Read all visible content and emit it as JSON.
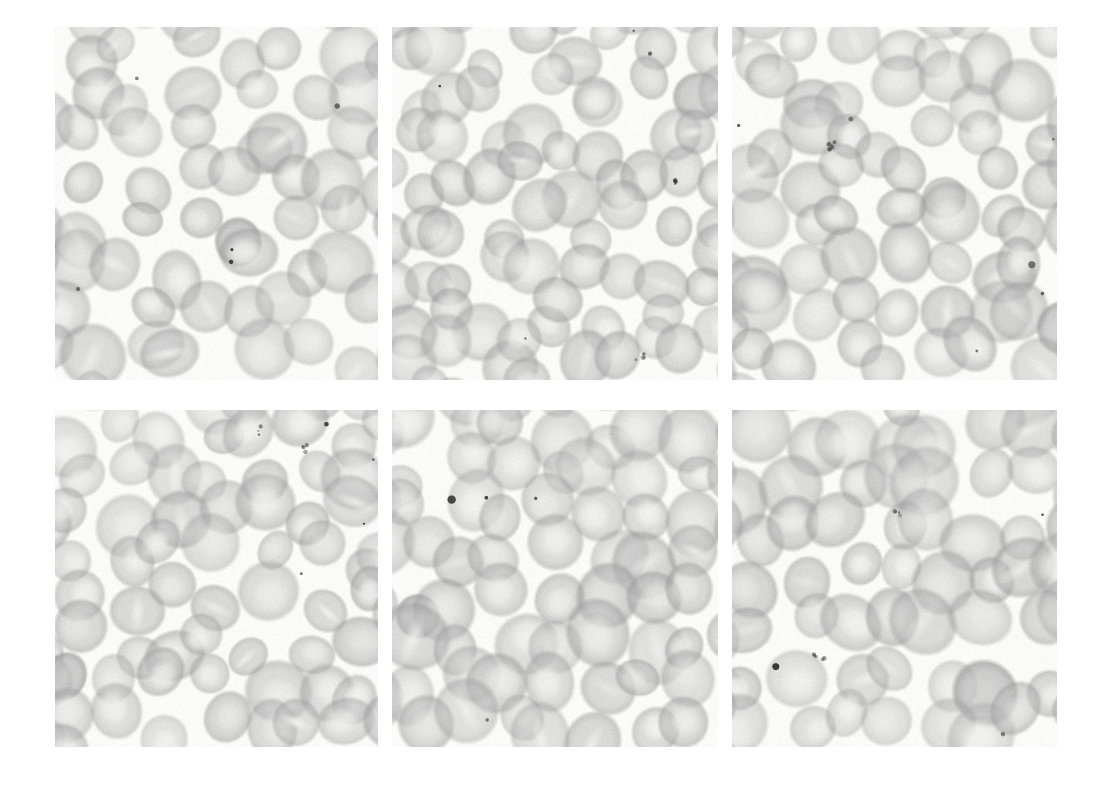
{
  "figure": {
    "kind": "micrograph-grid",
    "title": "",
    "caption": "",
    "background_color": "#ffffff",
    "width": 1110,
    "height": 792,
    "rows": 2,
    "columns": 3,
    "specimen": "peripheral blood smear",
    "stain_tone": "grayscale",
    "panel_background": "#fbfbfa",
    "cell_fill_color": "#b9b9b9",
    "cell_edge_color": "#9a9a9a",
    "cell_pallor_color": "#f2f2f1",
    "inclusion_color": "#2b2b2b"
  },
  "panels": [
    {
      "id": "panel-1",
      "label": "",
      "row": 0,
      "column": 0,
      "x": 55,
      "y": 27,
      "width": 323,
      "height": 353,
      "description": "sparse field of discoid red blood cells with prominent central pallor",
      "cell_count": 46,
      "mean_cell_diameter": 56,
      "density": "sparse",
      "seed": 1087,
      "inclusions": 5
    },
    {
      "id": "panel-2",
      "label": "",
      "row": 0,
      "column": 1,
      "x": 392,
      "y": 27,
      "width": 326,
      "height": 353,
      "description": "densely packed overlapping red blood cells, some with slit-like pallor",
      "cell_count": 62,
      "mean_cell_diameter": 54,
      "density": "dense",
      "seed": 2243,
      "inclusions": 6
    },
    {
      "id": "panel-3",
      "label": "",
      "row": 0,
      "column": 2,
      "x": 732,
      "y": 27,
      "width": 325,
      "height": 353,
      "description": "moderately packed red blood cells with dark punctate inclusion bodies",
      "cell_count": 54,
      "mean_cell_diameter": 57,
      "density": "moderate",
      "seed": 3391,
      "inclusions": 7
    },
    {
      "id": "panel-4",
      "label": "",
      "row": 1,
      "column": 0,
      "x": 55,
      "y": 410,
      "width": 323,
      "height": 337,
      "description": "red blood cells with variable size, a few small dark stained granules",
      "cell_count": 52,
      "mean_cell_diameter": 55,
      "density": "moderate",
      "seed": 4517,
      "inclusions": 6
    },
    {
      "id": "panel-5",
      "label": "",
      "row": 1,
      "column": 1,
      "x": 392,
      "y": 410,
      "width": 326,
      "height": 337,
      "description": "evenly spaced pale red blood cells with broad central pallor",
      "cell_count": 50,
      "mean_cell_diameter": 58,
      "density": "moderate",
      "seed": 5629,
      "inclusions": 4
    },
    {
      "id": "panel-6",
      "label": "",
      "row": 1,
      "column": 2,
      "x": 732,
      "y": 410,
      "width": 325,
      "height": 337,
      "description": "red blood cells with one darker hyperchromic cell upper right",
      "cell_count": 48,
      "mean_cell_diameter": 59,
      "density": "moderate",
      "seed": 6733,
      "inclusions": 5
    }
  ]
}
